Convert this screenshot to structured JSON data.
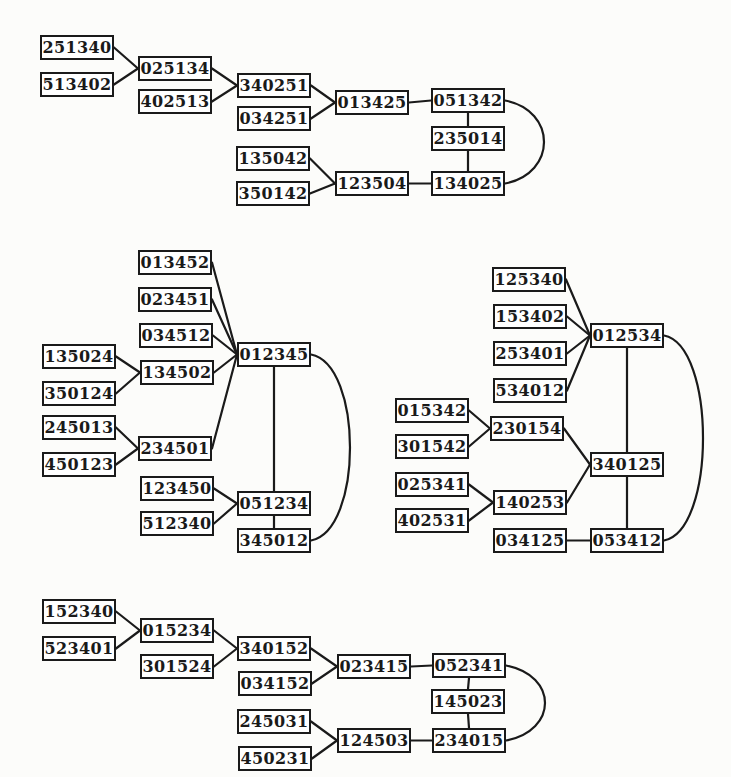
{
  "figure": {
    "canvas": {
      "width": 731,
      "height": 777,
      "background": "#fcfcfa",
      "ink": "#1a1a1a",
      "box_fill": "#ffffff"
    },
    "box": {
      "width": 74,
      "height": 25
    },
    "arc_bulge": 52,
    "clusters": [
      {
        "name": "top-tree",
        "nodes": [
          {
            "label": "251340",
            "x": 40,
            "y": 35
          },
          {
            "label": "513402",
            "x": 40,
            "y": 72
          },
          {
            "label": "025134",
            "x": 138,
            "y": 56
          },
          {
            "label": "402513",
            "x": 138,
            "y": 89
          },
          {
            "label": "340251",
            "x": 237,
            "y": 73
          },
          {
            "label": "034251",
            "x": 237,
            "y": 106
          },
          {
            "label": "135042",
            "x": 236,
            "y": 146
          },
          {
            "label": "350142",
            "x": 236,
            "y": 181
          },
          {
            "label": "013425",
            "x": 335,
            "y": 90
          },
          {
            "label": "123504",
            "x": 335,
            "y": 171
          },
          {
            "label": "051342",
            "x": 431,
            "y": 88
          },
          {
            "label": "235014",
            "x": 431,
            "y": 126
          },
          {
            "label": "134025",
            "x": 431,
            "y": 171
          }
        ],
        "edges": [
          {
            "from": "251340",
            "to": "025134",
            "type": "line"
          },
          {
            "from": "513402",
            "to": "025134",
            "type": "line"
          },
          {
            "from": "025134",
            "to": "340251",
            "type": "line"
          },
          {
            "from": "402513",
            "to": "340251",
            "type": "line"
          },
          {
            "from": "340251",
            "to": "013425",
            "type": "line"
          },
          {
            "from": "034251",
            "to": "013425",
            "type": "line"
          },
          {
            "from": "013425",
            "to": "051342",
            "type": "line"
          },
          {
            "from": "051342",
            "to": "235014",
            "type": "line"
          },
          {
            "from": "235014",
            "to": "134025",
            "type": "line"
          },
          {
            "from": "135042",
            "to": "123504",
            "type": "line"
          },
          {
            "from": "350142",
            "to": "123504",
            "type": "line"
          },
          {
            "from": "123504",
            "to": "134025",
            "type": "line"
          },
          {
            "from": "051342",
            "to": "134025",
            "type": "arc"
          }
        ]
      },
      {
        "name": "middle-left-tree",
        "nodes": [
          {
            "label": "013452",
            "x": 138,
            "y": 250
          },
          {
            "label": "023451",
            "x": 138,
            "y": 287
          },
          {
            "label": "034512",
            "x": 139,
            "y": 323
          },
          {
            "label": "135024",
            "x": 42,
            "y": 344
          },
          {
            "label": "134502",
            "x": 140,
            "y": 360
          },
          {
            "label": "350124",
            "x": 42,
            "y": 381
          },
          {
            "label": "012345",
            "x": 237,
            "y": 342
          },
          {
            "label": "245013",
            "x": 42,
            "y": 415
          },
          {
            "label": "450123",
            "x": 42,
            "y": 452
          },
          {
            "label": "234501",
            "x": 138,
            "y": 436
          },
          {
            "label": "123450",
            "x": 140,
            "y": 476
          },
          {
            "label": "051234",
            "x": 237,
            "y": 491
          },
          {
            "label": "512340",
            "x": 140,
            "y": 511
          },
          {
            "label": "345012",
            "x": 237,
            "y": 528
          }
        ],
        "edges": [
          {
            "from": "013452",
            "to": "012345",
            "type": "line"
          },
          {
            "from": "023451",
            "to": "012345",
            "type": "line"
          },
          {
            "from": "034512",
            "to": "012345",
            "type": "line"
          },
          {
            "from": "135024",
            "to": "134502",
            "type": "line"
          },
          {
            "from": "350124",
            "to": "134502",
            "type": "line"
          },
          {
            "from": "134502",
            "to": "012345",
            "type": "line"
          },
          {
            "from": "245013",
            "to": "234501",
            "type": "line"
          },
          {
            "from": "450123",
            "to": "234501",
            "type": "line"
          },
          {
            "from": "234501",
            "to": "012345",
            "type": "line"
          },
          {
            "from": "123450",
            "to": "051234",
            "type": "line"
          },
          {
            "from": "512340",
            "to": "051234",
            "type": "line"
          },
          {
            "from": "012345",
            "to": "051234",
            "type": "line"
          },
          {
            "from": "051234",
            "to": "345012",
            "type": "line"
          },
          {
            "from": "012345",
            "to": "345012",
            "type": "arc"
          }
        ]
      },
      {
        "name": "middle-right-tree",
        "nodes": [
          {
            "label": "125340",
            "x": 492,
            "y": 267
          },
          {
            "label": "153402",
            "x": 493,
            "y": 304
          },
          {
            "label": "253401",
            "x": 493,
            "y": 341
          },
          {
            "label": "534012",
            "x": 493,
            "y": 378
          },
          {
            "label": "012534",
            "x": 590,
            "y": 323
          },
          {
            "label": "015342",
            "x": 395,
            "y": 398
          },
          {
            "label": "301542",
            "x": 395,
            "y": 434
          },
          {
            "label": "230154",
            "x": 490,
            "y": 416
          },
          {
            "label": "025341",
            "x": 395,
            "y": 472
          },
          {
            "label": "402531",
            "x": 395,
            "y": 508
          },
          {
            "label": "140253",
            "x": 493,
            "y": 490
          },
          {
            "label": "340125",
            "x": 590,
            "y": 452
          },
          {
            "label": "034125",
            "x": 493,
            "y": 528
          },
          {
            "label": "053412",
            "x": 590,
            "y": 528
          }
        ],
        "edges": [
          {
            "from": "125340",
            "to": "012534",
            "type": "line"
          },
          {
            "from": "153402",
            "to": "012534",
            "type": "line"
          },
          {
            "from": "253401",
            "to": "012534",
            "type": "line"
          },
          {
            "from": "534012",
            "to": "012534",
            "type": "line"
          },
          {
            "from": "015342",
            "to": "230154",
            "type": "line"
          },
          {
            "from": "301542",
            "to": "230154",
            "type": "line"
          },
          {
            "from": "230154",
            "to": "340125",
            "type": "line"
          },
          {
            "from": "025341",
            "to": "140253",
            "type": "line"
          },
          {
            "from": "402531",
            "to": "140253",
            "type": "line"
          },
          {
            "from": "140253",
            "to": "340125",
            "type": "line"
          },
          {
            "from": "012534",
            "to": "340125",
            "type": "line"
          },
          {
            "from": "340125",
            "to": "053412",
            "type": "line"
          },
          {
            "from": "034125",
            "to": "053412",
            "type": "line"
          },
          {
            "from": "012534",
            "to": "053412",
            "type": "arc"
          }
        ]
      },
      {
        "name": "bottom-tree",
        "nodes": [
          {
            "label": "152340",
            "x": 42,
            "y": 599
          },
          {
            "label": "523401",
            "x": 42,
            "y": 636
          },
          {
            "label": "015234",
            "x": 140,
            "y": 618
          },
          {
            "label": "301524",
            "x": 140,
            "y": 654
          },
          {
            "label": "340152",
            "x": 237,
            "y": 636
          },
          {
            "label": "034152",
            "x": 238,
            "y": 671
          },
          {
            "label": "245031",
            "x": 237,
            "y": 709
          },
          {
            "label": "450231",
            "x": 238,
            "y": 746
          },
          {
            "label": "023415",
            "x": 337,
            "y": 654
          },
          {
            "label": "124503",
            "x": 337,
            "y": 728
          },
          {
            "label": "052341",
            "x": 432,
            "y": 653
          },
          {
            "label": "145023",
            "x": 431,
            "y": 689
          },
          {
            "label": "234015",
            "x": 432,
            "y": 728
          }
        ],
        "edges": [
          {
            "from": "152340",
            "to": "015234",
            "type": "line"
          },
          {
            "from": "523401",
            "to": "015234",
            "type": "line"
          },
          {
            "from": "015234",
            "to": "340152",
            "type": "line"
          },
          {
            "from": "301524",
            "to": "340152",
            "type": "line"
          },
          {
            "from": "340152",
            "to": "023415",
            "type": "line"
          },
          {
            "from": "034152",
            "to": "023415",
            "type": "line"
          },
          {
            "from": "023415",
            "to": "052341",
            "type": "line"
          },
          {
            "from": "052341",
            "to": "145023",
            "type": "line"
          },
          {
            "from": "145023",
            "to": "234015",
            "type": "line"
          },
          {
            "from": "245031",
            "to": "124503",
            "type": "line"
          },
          {
            "from": "450231",
            "to": "124503",
            "type": "line"
          },
          {
            "from": "124503",
            "to": "234015",
            "type": "line"
          },
          {
            "from": "052341",
            "to": "234015",
            "type": "arc"
          }
        ]
      }
    ]
  }
}
